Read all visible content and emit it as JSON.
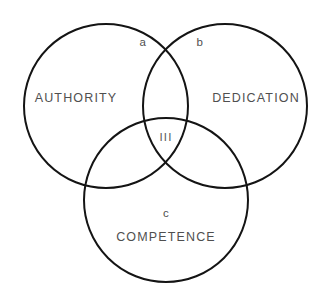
{
  "diagram": {
    "type": "venn-3-set",
    "title": "",
    "background_color": "#ffffff",
    "stroke_color": "#141414",
    "label_color": "#4f4f4f",
    "sets": [
      {
        "id": "authority",
        "label": "AUTHORITY",
        "cx": 106,
        "cy": 106,
        "r": 82,
        "label_x": 76,
        "label_y": 99
      },
      {
        "id": "dedication",
        "label": "DEDICATION",
        "cx": 225,
        "cy": 106,
        "r": 82,
        "label_x": 256,
        "label_y": 99
      },
      {
        "id": "competence",
        "label": "COMPETENCE",
        "cx": 166,
        "cy": 200,
        "r": 82,
        "label_x": 166,
        "label_y": 238
      }
    ],
    "regions": [
      {
        "id": "region-a",
        "label": "a",
        "x": 143,
        "y": 43
      },
      {
        "id": "region-b",
        "label": "b",
        "x": 200,
        "y": 43
      },
      {
        "id": "region-center",
        "label": "III",
        "x": 166,
        "y": 138
      },
      {
        "id": "region-c",
        "label": "c",
        "x": 166,
        "y": 214
      }
    ]
  }
}
